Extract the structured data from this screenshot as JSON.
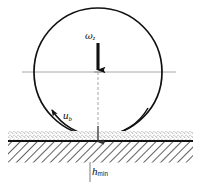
{
  "figure": {
    "background_color": "#ffffff",
    "line_color": "#111111",
    "centerline_color": "#a8a8a8",
    "hatch_color": "#2a2a2a",
    "stipple_color": "#8a8a8a"
  },
  "labels": {
    "angular_velocity": {
      "symbol": "ω",
      "subscript": "z",
      "name": "omega-z"
    },
    "surface_velocity": {
      "symbol": "u",
      "subscript": "b",
      "name": "u-b"
    },
    "film_thickness": {
      "symbol": "h",
      "subscript": "min",
      "name": "h-min"
    }
  },
  "geometry": {
    "ball": {
      "center_x": 98,
      "center_y": 72,
      "radius": 64
    },
    "surface_line_y": 141,
    "hatch_band_top": 141,
    "hatch_band_bottom": 162,
    "stipple_band_top": 132,
    "stipple_band_bottom": 141
  },
  "icons": {
    "down_arrow": "down-arrow-icon",
    "rotation_arc": "rotation-arc-arrow-icon",
    "dimension_arrow": "dimension-arrow-icon"
  }
}
